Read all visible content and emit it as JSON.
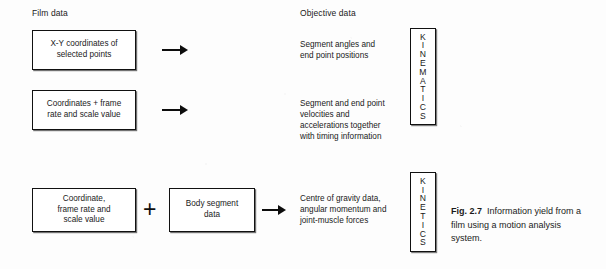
{
  "figure": {
    "columns": {
      "left_heading": "Film data",
      "right_heading": "Objective data"
    },
    "rows": [
      {
        "input_box": "X-Y coordinates of\nselected points",
        "arrow": "right-arrow",
        "output_text": "Segment angles and\nend point positions"
      },
      {
        "input_box": "Coordinates + frame\nrate and scale value",
        "arrow": "right-arrow",
        "output_text": "Segment and end point\nvelocities and\naccelerations together\nwith timing information"
      },
      {
        "input_box": "Coordinate,\nframe rate and\nscale value",
        "operator": "+",
        "second_box": "Body segment\ndata",
        "arrow": "right-arrow",
        "output_text": "Centre of gravity data,\nangular momentum and\njoint-muscle forces"
      }
    ],
    "category_labels": [
      {
        "name": "kinematics",
        "letters": [
          "K",
          "I",
          "N",
          "E",
          "M",
          "A",
          "T",
          "I",
          "C",
          "S"
        ]
      },
      {
        "name": "kinetics",
        "letters": [
          "K",
          "I",
          "N",
          "E",
          "T",
          "I",
          "C",
          "S"
        ]
      }
    ],
    "caption": {
      "number": "Fig. 2.7",
      "text": "Information yield from a film using a motion analysis system."
    }
  },
  "colors": {
    "ink": "#111111",
    "page": "#fdfdfd"
  }
}
